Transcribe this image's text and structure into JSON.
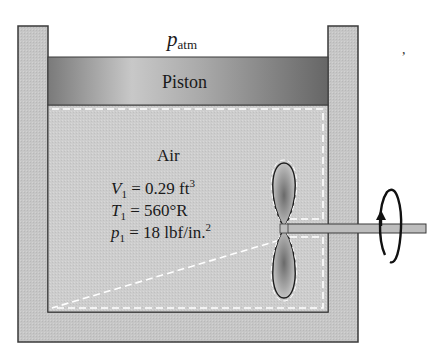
{
  "figure": {
    "type": "piston-cylinder with paddle wheel",
    "labels": {
      "atmosphere": {
        "symbol": "p",
        "subscript": "atm"
      },
      "piston": "Piston",
      "gas": "Air",
      "state": [
        {
          "symbol": "V",
          "subscript": "1",
          "text": " = 0.29 ft",
          "superscript": "3"
        },
        {
          "symbol": "T",
          "subscript": "1",
          "text": " = 560°R",
          "superscript": ""
        },
        {
          "symbol": "p",
          "subscript": "1",
          "text": " = 18 lbf/in.",
          "superscript": "2"
        }
      ],
      "stray_mark": ","
    },
    "colors": {
      "wall": "#c4c4c4",
      "wall_edge": "#3a3a3a",
      "piston_light": "#bdbdbd",
      "piston_dark": "#6e6e6e",
      "air": "#cfcfcf",
      "shaft": "#bdbdbd",
      "paddle_center": "#7a7a7a",
      "dashed_boundary": "#ffffff"
    }
  }
}
